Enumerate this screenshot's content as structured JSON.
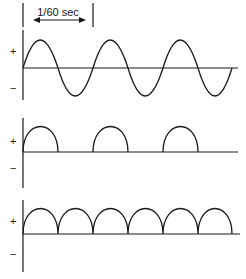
{
  "period_marker": {
    "label": "1/60 sec"
  },
  "panels": [
    {
      "name": "full-ac-sine",
      "plus": "+",
      "minus": "−"
    },
    {
      "name": "half-wave-rectified",
      "plus": "+",
      "minus": "−"
    },
    {
      "name": "full-wave-rectified",
      "plus": "+",
      "minus": "−"
    }
  ],
  "colors": {
    "stroke": "#1a1a1a",
    "background": "#ffffff"
  }
}
